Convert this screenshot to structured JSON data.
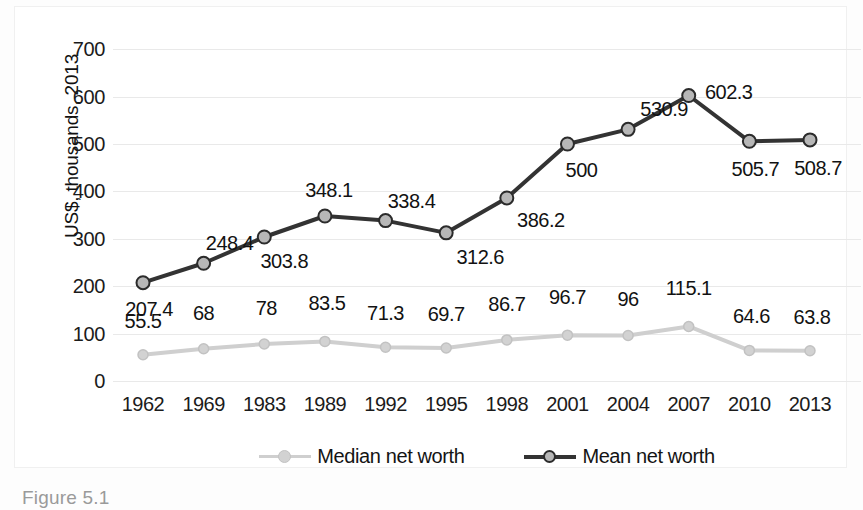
{
  "chart_data": {
    "type": "line",
    "title": "",
    "xlabel": "",
    "ylabel": "US$, thousands, 2013",
    "categories": [
      "1962",
      "1969",
      "1983",
      "1989",
      "1992",
      "1995",
      "1998",
      "2001",
      "2004",
      "2007",
      "2010",
      "2013"
    ],
    "series": [
      {
        "name": "Median net worth",
        "color": "#cfcfcf",
        "marker_fill": "#d2d2d2",
        "marker_stroke": "#c2c2c2",
        "values": [
          55.5,
          68,
          78,
          83.5,
          71.3,
          69.7,
          86.7,
          96.7,
          96,
          115.1,
          64.6,
          63.8
        ],
        "labels": [
          "55.5",
          "68",
          "78",
          "83.5",
          "71.3",
          "69.7",
          "86.7",
          "96.7",
          "96",
          "115.1",
          "64.6",
          "63.8"
        ]
      },
      {
        "name": "Mean net worth",
        "color": "#333333",
        "marker_fill": "#b7b7b7",
        "marker_stroke": "#2b2b2b",
        "values": [
          207.4,
          248.4,
          303.8,
          348.1,
          338.4,
          312.6,
          386.2,
          500,
          530.9,
          602.3,
          505.7,
          508.7
        ],
        "labels": [
          "207.4",
          "248.4",
          "303.8",
          "348.1",
          "338.4",
          "312.6",
          "386.2",
          "500",
          "530.9",
          "602.3",
          "505.7",
          "508.7"
        ]
      }
    ],
    "yticks": [
      0,
      100,
      200,
      300,
      400,
      500,
      600,
      700
    ],
    "ytick_labels": [
      "0",
      "100",
      "200",
      "300",
      "400",
      "500",
      "600",
      "700"
    ],
    "ylim": [
      0,
      730
    ],
    "grid": true,
    "legend_position": "bottom"
  },
  "caption": {
    "text": "Figure 5.1"
  }
}
